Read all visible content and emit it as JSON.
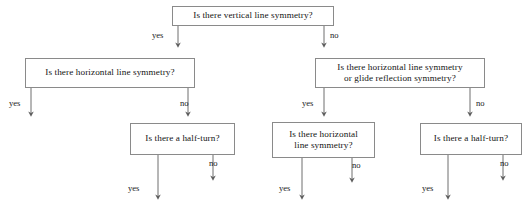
{
  "diagram": {
    "stroke_color": "#8a8a8a",
    "line_color": "#6e6e6e",
    "text_color": "#141414",
    "background": "#ffffff"
  },
  "nodes": [
    {
      "id": "q-vertical",
      "text": "Is there vertical line symmetry?",
      "x": 172,
      "y": 6,
      "w": 162,
      "h": 20
    },
    {
      "id": "q-horizontal-left",
      "text": "Is there horizontal line symmetry?",
      "x": 25,
      "y": 58,
      "w": 170,
      "h": 30
    },
    {
      "id": "q-horizontal-or-glide",
      "text": "Is there horizontal line symmetry\nor glide reflection symmetry?",
      "x": 315,
      "y": 58,
      "w": 170,
      "h": 30
    },
    {
      "id": "q-halfturn-left",
      "text": "Is there a half-turn?",
      "x": 130,
      "y": 123,
      "w": 105,
      "h": 32
    },
    {
      "id": "q-horizontal-mid",
      "text": "Is there horizontal\nline symmetry?",
      "x": 272,
      "y": 122,
      "w": 103,
      "h": 36
    },
    {
      "id": "q-halfturn-right",
      "text": "Is there a half-turn?",
      "x": 420,
      "y": 123,
      "w": 102,
      "h": 32
    }
  ],
  "edges": [
    {
      "id": "e-vertical-yes",
      "label": "yes",
      "label_x": 152,
      "label_y": 31,
      "from": "q-vertical",
      "to": "q-horizontal-left"
    },
    {
      "id": "e-vertical-no",
      "label": "no",
      "label_x": 330,
      "label_y": 31,
      "from": "q-vertical",
      "to": "q-horizontal-or-glide"
    },
    {
      "id": "e-horizontal-left-yes",
      "label": "yes",
      "label_x": 9,
      "label_y": 99,
      "from": "q-horizontal-left",
      "to": "terminal"
    },
    {
      "id": "e-horizontal-left-no",
      "label": "no",
      "label_x": 180,
      "label_y": 99,
      "from": "q-horizontal-left",
      "to": "q-halfturn-left"
    },
    {
      "id": "e-glide-yes",
      "label": "yes",
      "label_x": 302,
      "label_y": 99,
      "from": "q-horizontal-or-glide",
      "to": "q-horizontal-mid"
    },
    {
      "id": "e-glide-no",
      "label": "no",
      "label_x": 476,
      "label_y": 99,
      "from": "q-horizontal-or-glide",
      "to": "q-halfturn-right"
    },
    {
      "id": "e-halfturn-left-yes",
      "label": "yes",
      "label_x": 128,
      "label_y": 184,
      "from": "q-halfturn-left",
      "to": "terminal"
    },
    {
      "id": "e-halfturn-left-no",
      "label": "no",
      "label_x": 209,
      "label_y": 159,
      "from": "q-halfturn-left",
      "to": "terminal"
    },
    {
      "id": "e-horizontal-mid-yes",
      "label": "yes",
      "label_x": 279,
      "label_y": 184,
      "from": "q-horizontal-mid",
      "to": "terminal"
    },
    {
      "id": "e-horizontal-mid-no",
      "label": "no",
      "label_x": 352,
      "label_y": 161,
      "from": "q-horizontal-mid",
      "to": "terminal"
    },
    {
      "id": "e-halfturn-right-yes",
      "label": "yes",
      "label_x": 422,
      "label_y": 184,
      "from": "q-halfturn-right",
      "to": "terminal"
    },
    {
      "id": "e-halfturn-right-no",
      "label": "no",
      "label_x": 500,
      "label_y": 159,
      "from": "q-halfturn-right",
      "to": "terminal"
    }
  ]
}
